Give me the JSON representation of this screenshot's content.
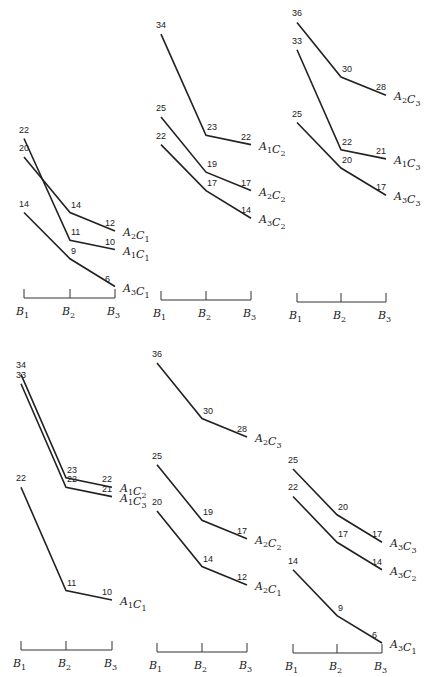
{
  "chart_data": [
    {
      "type": "line",
      "title": "",
      "xlabel": "",
      "ylabel": "",
      "categories": [
        "B1",
        "B2",
        "B3"
      ],
      "series": [
        {
          "name": "A2C1",
          "values": [
            20,
            14,
            12
          ]
        },
        {
          "name": "A1C1",
          "values": [
            22,
            11,
            10
          ]
        },
        {
          "name": "A3C1",
          "values": [
            14,
            9,
            6
          ]
        }
      ],
      "layout": {
        "x0": 24,
        "x1": 70,
        "x2": 115,
        "axis_y": 298,
        "base_y": 342,
        "scale": 9.25
      }
    },
    {
      "type": "line",
      "title": "",
      "xlabel": "",
      "ylabel": "",
      "categories": [
        "B1",
        "B2",
        "B3"
      ],
      "series": [
        {
          "name": "A1C2",
          "values": [
            34,
            23,
            22
          ]
        },
        {
          "name": "A2C2",
          "values": [
            25,
            19,
            17
          ]
        },
        {
          "name": "A3C2",
          "values": [
            22,
            17,
            14
          ]
        }
      ],
      "layout": {
        "x0": 161,
        "x1": 206,
        "x2": 251,
        "axis_y": 300,
        "base_y": 347,
        "scale": 9.2
      }
    },
    {
      "type": "line",
      "title": "",
      "xlabel": "",
      "ylabel": "",
      "categories": [
        "B1",
        "B2",
        "B3"
      ],
      "series": [
        {
          "name": "A2C3",
          "values": [
            36,
            30,
            28
          ]
        },
        {
          "name": "A1C3",
          "values": [
            33,
            22,
            21
          ]
        },
        {
          "name": "A3C3",
          "values": [
            25,
            20,
            17
          ]
        }
      ],
      "layout": {
        "x0": 297,
        "x1": 341,
        "x2": 386,
        "axis_y": 302,
        "base_y": 350,
        "scale": 9.1
      }
    },
    {
      "type": "line",
      "title": "",
      "xlabel": "",
      "ylabel": "",
      "categories": [
        "B1",
        "B2",
        "B3"
      ],
      "series": [
        {
          "name": "A1C2",
          "values": [
            34,
            23,
            22
          ]
        },
        {
          "name": "A1C3",
          "values": [
            33,
            22,
            21
          ]
        },
        {
          "name": "A1C1",
          "values": [
            22,
            11,
            10
          ]
        }
      ],
      "layout": {
        "x0": 21,
        "x1": 66,
        "x2": 112,
        "axis_y": 650,
        "base_y": 694,
        "scale": 9.4
      }
    },
    {
      "type": "line",
      "title": "",
      "xlabel": "",
      "ylabel": "",
      "categories": [
        "B1",
        "B2",
        "B3"
      ],
      "series": [
        {
          "name": "A2C3",
          "values": [
            36,
            30,
            28
          ]
        },
        {
          "name": "A2C2",
          "values": [
            25,
            19,
            17
          ]
        },
        {
          "name": "A2C1",
          "values": [
            20,
            14,
            12
          ]
        }
      ],
      "layout": {
        "x0": 157,
        "x1": 202,
        "x2": 247,
        "axis_y": 652,
        "base_y": 696,
        "scale": 9.25
      }
    },
    {
      "type": "line",
      "title": "",
      "xlabel": "",
      "ylabel": "",
      "categories": [
        "B1",
        "B2",
        "B3"
      ],
      "series": [
        {
          "name": "A3C3",
          "values": [
            25,
            20,
            17
          ]
        },
        {
          "name": "A3C2",
          "values": [
            22,
            17,
            14
          ]
        },
        {
          "name": "A3C1",
          "values": [
            14,
            9,
            6
          ]
        }
      ],
      "layout": {
        "x0": 293,
        "x1": 337,
        "x2": 382,
        "axis_y": 653,
        "base_y": 698,
        "scale": 9.16
      }
    }
  ]
}
